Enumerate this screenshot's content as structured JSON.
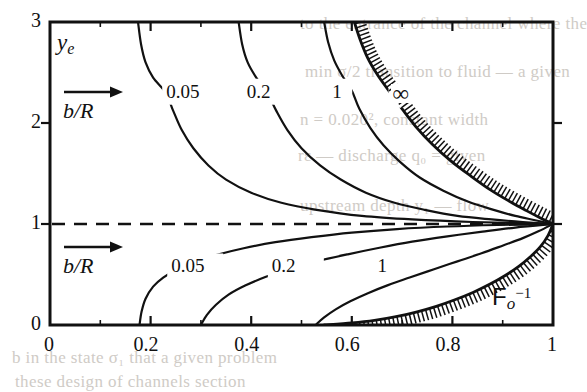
{
  "figure": {
    "background_color": "#ffffff",
    "line_color": "#111111",
    "axis_title_y": "ye",
    "axis_title_y_base": "y",
    "axis_title_y_sub": "e",
    "axis_title_x_base": "F",
    "axis_title_x_sub": "o",
    "axis_title_x_sup": "−1",
    "axis_title_x": "Fo⁻¹",
    "legend_arrow_label_upper": "b/R",
    "legend_arrow_label_lower": "b/R",
    "arrow_icon": "right-arrow-icon"
  },
  "chart_data": {
    "type": "line",
    "title": "",
    "xlabel": "Fo^-1",
    "ylabel": "y_e",
    "xlim": [
      0,
      1
    ],
    "ylim": [
      0,
      3
    ],
    "grid": false,
    "legend_position": "inline-labels",
    "xticks": [
      0,
      0.2,
      0.4,
      0.6,
      0.8,
      1
    ],
    "xtick_labels": [
      "0",
      "0.2",
      "0.4",
      "0.6",
      "0.8",
      "1"
    ],
    "yticks": [
      0,
      1,
      2,
      3
    ],
    "ytick_labels": [
      "0",
      "1",
      "2",
      "3"
    ],
    "x_minor_ticks": [
      0.1,
      0.3,
      0.5,
      0.7,
      0.9
    ],
    "y_minor_ticks": [
      0.5,
      1.5,
      2.5
    ],
    "reference_line": {
      "name": "y_e = 1",
      "value": 1,
      "orientation": "horizontal",
      "style": "dashed"
    },
    "convergence_point": [
      1,
      1
    ],
    "annotations": [
      {
        "text": "0.05",
        "x": 0.235,
        "y": 2.28,
        "branch": "upper"
      },
      {
        "text": "0.2",
        "x": 0.395,
        "y": 2.28,
        "branch": "upper"
      },
      {
        "text": "1",
        "x": 0.565,
        "y": 2.28,
        "branch": "upper"
      },
      {
        "text": "∞",
        "x": 0.685,
        "y": 2.25,
        "branch": "upper"
      },
      {
        "text": "0.05",
        "x": 0.245,
        "y": 0.55,
        "branch": "lower"
      },
      {
        "text": "0.2",
        "x": 0.445,
        "y": 0.55,
        "branch": "lower"
      },
      {
        "text": "1",
        "x": 0.655,
        "y": 0.55,
        "branch": "lower"
      }
    ],
    "series": [
      {
        "name": "b/R = 0.05 (upper)",
        "label": "0.05",
        "branch": "upper",
        "points": [
          [
            0.175,
            3.0
          ],
          [
            0.181,
            2.78
          ],
          [
            0.19,
            2.6
          ],
          [
            0.205,
            2.45
          ],
          [
            0.23,
            2.3
          ],
          [
            0.245,
            2.12
          ],
          [
            0.262,
            1.93
          ],
          [
            0.285,
            1.75
          ],
          [
            0.315,
            1.58
          ],
          [
            0.35,
            1.44
          ],
          [
            0.4,
            1.31
          ],
          [
            0.46,
            1.21
          ],
          [
            0.53,
            1.14
          ],
          [
            0.62,
            1.08
          ],
          [
            0.72,
            1.045
          ],
          [
            0.84,
            1.02
          ],
          [
            1.0,
            1.0
          ]
        ]
      },
      {
        "name": "b/R = 0.2 (upper)",
        "label": "0.2",
        "branch": "upper",
        "points": [
          [
            0.375,
            3.0
          ],
          [
            0.382,
            2.78
          ],
          [
            0.393,
            2.6
          ],
          [
            0.41,
            2.45
          ],
          [
            0.432,
            2.3
          ],
          [
            0.45,
            2.12
          ],
          [
            0.472,
            1.93
          ],
          [
            0.5,
            1.75
          ],
          [
            0.537,
            1.58
          ],
          [
            0.578,
            1.44
          ],
          [
            0.628,
            1.31
          ],
          [
            0.685,
            1.21
          ],
          [
            0.745,
            1.14
          ],
          [
            0.81,
            1.08
          ],
          [
            0.878,
            1.045
          ],
          [
            0.94,
            1.02
          ],
          [
            1.0,
            1.0
          ]
        ]
      },
      {
        "name": "b/R = 1 (upper)",
        "label": "1",
        "branch": "upper",
        "points": [
          [
            0.545,
            3.0
          ],
          [
            0.553,
            2.8
          ],
          [
            0.565,
            2.62
          ],
          [
            0.582,
            2.46
          ],
          [
            0.6,
            2.32
          ],
          [
            0.615,
            2.14
          ],
          [
            0.637,
            1.95
          ],
          [
            0.663,
            1.78
          ],
          [
            0.697,
            1.61
          ],
          [
            0.735,
            1.46
          ],
          [
            0.782,
            1.33
          ],
          [
            0.832,
            1.22
          ],
          [
            0.882,
            1.14
          ],
          [
            0.925,
            1.08
          ],
          [
            0.962,
            1.04
          ],
          [
            1.0,
            1.0
          ]
        ]
      },
      {
        "name": "b/R = ∞ (upper, hatched limit)",
        "label": "∞",
        "branch": "upper",
        "hatched": true,
        "hatch_side": "outer",
        "points": [
          [
            0.605,
            3.0
          ],
          [
            0.617,
            2.82
          ],
          [
            0.632,
            2.64
          ],
          [
            0.652,
            2.47
          ],
          [
            0.675,
            2.31
          ],
          [
            0.7,
            2.14
          ],
          [
            0.728,
            1.96
          ],
          [
            0.76,
            1.79
          ],
          [
            0.798,
            1.62
          ],
          [
            0.838,
            1.47
          ],
          [
            0.878,
            1.33
          ],
          [
            0.915,
            1.22
          ],
          [
            0.948,
            1.13
          ],
          [
            0.975,
            1.06
          ],
          [
            1.0,
            1.0
          ]
        ]
      },
      {
        "name": "b/R = 0.05 (lower)",
        "label": "0.05",
        "branch": "lower",
        "points": [
          [
            0.178,
            0.0
          ],
          [
            0.182,
            0.13
          ],
          [
            0.19,
            0.26
          ],
          [
            0.205,
            0.38
          ],
          [
            0.225,
            0.47
          ],
          [
            0.252,
            0.55
          ],
          [
            0.288,
            0.625
          ],
          [
            0.332,
            0.695
          ],
          [
            0.385,
            0.76
          ],
          [
            0.448,
            0.82
          ],
          [
            0.52,
            0.87
          ],
          [
            0.6,
            0.915
          ],
          [
            0.69,
            0.95
          ],
          [
            0.79,
            0.975
          ],
          [
            0.89,
            0.99
          ],
          [
            1.0,
            1.0
          ]
        ]
      },
      {
        "name": "b/R = 0.2 (lower)",
        "label": "0.2",
        "branch": "lower",
        "points": [
          [
            0.3,
            0.0
          ],
          [
            0.312,
            0.1
          ],
          [
            0.33,
            0.2
          ],
          [
            0.355,
            0.3
          ],
          [
            0.388,
            0.39
          ],
          [
            0.428,
            0.475
          ],
          [
            0.475,
            0.555
          ],
          [
            0.53,
            0.63
          ],
          [
            0.592,
            0.7
          ],
          [
            0.655,
            0.765
          ],
          [
            0.72,
            0.825
          ],
          [
            0.79,
            0.878
          ],
          [
            0.86,
            0.925
          ],
          [
            0.925,
            0.965
          ],
          [
            1.0,
            1.0
          ]
        ]
      },
      {
        "name": "b/R = 1 (lower)",
        "label": "1",
        "branch": "lower",
        "points": [
          [
            0.528,
            0.0
          ],
          [
            0.545,
            0.075
          ],
          [
            0.568,
            0.155
          ],
          [
            0.597,
            0.235
          ],
          [
            0.632,
            0.315
          ],
          [
            0.672,
            0.395
          ],
          [
            0.715,
            0.47
          ],
          [
            0.762,
            0.55
          ],
          [
            0.81,
            0.63
          ],
          [
            0.858,
            0.71
          ],
          [
            0.902,
            0.79
          ],
          [
            0.94,
            0.86
          ],
          [
            0.972,
            0.93
          ],
          [
            1.0,
            1.0
          ]
        ]
      },
      {
        "name": "b/R = ∞ (lower, hatched limit)",
        "label": "∞",
        "branch": "lower",
        "hatched": true,
        "hatch_side": "outer",
        "points": [
          [
            0.545,
            0.0
          ],
          [
            0.6,
            0.02
          ],
          [
            0.645,
            0.045
          ],
          [
            0.688,
            0.082
          ],
          [
            0.728,
            0.128
          ],
          [
            0.768,
            0.185
          ],
          [
            0.805,
            0.25
          ],
          [
            0.842,
            0.325
          ],
          [
            0.875,
            0.405
          ],
          [
            0.905,
            0.49
          ],
          [
            0.932,
            0.58
          ],
          [
            0.955,
            0.675
          ],
          [
            0.975,
            0.775
          ],
          [
            0.99,
            0.885
          ],
          [
            1.0,
            1.0
          ]
        ]
      }
    ]
  },
  "background_text": [
    {
      "text": "to  the  entrance  of  the  channel  where  the",
      "x": 300,
      "y": 14
    },
    {
      "text": "min  σ/2 transition  to  fluid  —  a  given",
      "x": 305,
      "y": 62
    },
    {
      "text": "n  =  0.020²,  constant  width",
      "x": 300,
      "y": 110
    },
    {
      "text": "rε  —  discharge  q₀  =  given",
      "x": 298,
      "y": 146
    },
    {
      "text": "upstream  depth  y₁  —  flow",
      "x": 300,
      "y": 196
    },
    {
      "text": "b  in  the  state  σ₁  that  a  given  problem",
      "x": 12,
      "y": 348
    },
    {
      "text": "these  design  of  channels  section",
      "x": 15,
      "y": 372
    }
  ]
}
